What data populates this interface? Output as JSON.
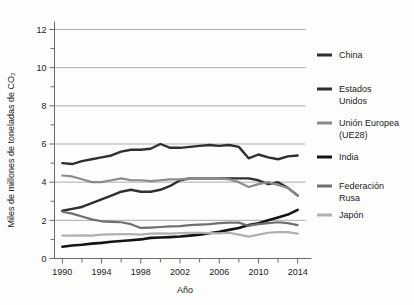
{
  "chart_data": {
    "type": "line",
    "title": "",
    "xlabel": "Año",
    "ylabel": "Miles de millones de toneladas de CO₂",
    "xlim": [
      1989.2,
      2014.8
    ],
    "ylim": [
      0,
      12
    ],
    "xticks": [
      1990,
      1994,
      1998,
      2002,
      2006,
      2010,
      2014
    ],
    "xticklabels": [
      "1990",
      "1994",
      "1998",
      "2002",
      "2006",
      "2010",
      "2014"
    ],
    "yticks": [
      0,
      2,
      4,
      6,
      8,
      10,
      12
    ],
    "yticklabels": [
      "0",
      "2",
      "4",
      "6",
      "8",
      "10",
      "12"
    ],
    "y_minor_ticks": [
      1,
      3,
      5,
      7,
      9,
      11
    ],
    "grid": "horizontal",
    "legend_position": "right",
    "x": [
      1990,
      1991,
      1992,
      1993,
      1994,
      1995,
      1996,
      1997,
      1998,
      1999,
      2000,
      2001,
      2002,
      2003,
      2004,
      2005,
      2006,
      2007,
      2008,
      2009,
      2010,
      2011,
      2012,
      2013,
      2014
    ],
    "series": [
      {
        "name": "China",
        "color": "#2f2f2f",
        "width": 2.4,
        "values": [
          2.5,
          2.6,
          2.7,
          2.9,
          3.1,
          3.3,
          3.5,
          3.6,
          3.5,
          3.5,
          3.6,
          3.8,
          4.1,
          4.2,
          4.2,
          4.2,
          4.2,
          4.2,
          4.2,
          4.2,
          4.1,
          3.9,
          4.0,
          3.7,
          3.3
        ]
      },
      {
        "name": "Estados Unidos",
        "color": "#2f2f2f",
        "width": 2.4,
        "values": [
          5.0,
          4.95,
          5.1,
          5.2,
          5.3,
          5.4,
          5.6,
          5.7,
          5.7,
          5.75,
          6.0,
          5.8,
          5.8,
          5.85,
          5.9,
          5.95,
          5.9,
          5.95,
          5.85,
          5.25,
          5.45,
          5.3,
          5.2,
          5.35,
          5.4
        ]
      },
      {
        "name": "Unión Europea (UE28)",
        "color": "#8c8c8c",
        "width": 2.2,
        "values": [
          4.35,
          4.3,
          4.15,
          4.0,
          4.0,
          4.1,
          4.2,
          4.1,
          4.1,
          4.05,
          4.1,
          4.15,
          4.15,
          4.2,
          4.2,
          4.2,
          4.2,
          4.15,
          4.0,
          3.75,
          3.9,
          4.0,
          3.85,
          3.7,
          3.3
        ]
      },
      {
        "name": "India",
        "color": "#141414",
        "width": 2.6,
        "values": [
          0.62,
          0.68,
          0.72,
          0.78,
          0.82,
          0.88,
          0.92,
          0.96,
          1.0,
          1.08,
          1.1,
          1.12,
          1.15,
          1.2,
          1.25,
          1.32,
          1.4,
          1.5,
          1.6,
          1.75,
          1.85,
          2.0,
          2.15,
          2.3,
          2.55
        ]
      },
      {
        "name": "Federación Rusa",
        "color": "#6f6f6f",
        "width": 2.2,
        "values": [
          2.45,
          2.35,
          2.2,
          2.05,
          1.95,
          1.92,
          1.9,
          1.8,
          1.6,
          1.62,
          1.65,
          1.68,
          1.7,
          1.75,
          1.78,
          1.8,
          1.85,
          1.88,
          1.88,
          1.72,
          1.8,
          1.85,
          1.9,
          1.85,
          1.75
        ]
      },
      {
        "name": "Japón",
        "color": "#b0b0b0",
        "width": 2.2,
        "values": [
          1.2,
          1.2,
          1.21,
          1.2,
          1.25,
          1.26,
          1.28,
          1.28,
          1.25,
          1.3,
          1.32,
          1.3,
          1.33,
          1.35,
          1.35,
          1.33,
          1.32,
          1.35,
          1.25,
          1.15,
          1.25,
          1.35,
          1.38,
          1.38,
          1.3
        ]
      }
    ],
    "legend": [
      {
        "label": "China",
        "color": "#2f2f2f",
        "lines": [
          "China"
        ]
      },
      {
        "label": "Estados Unidos",
        "color": "#2f2f2f",
        "lines": [
          "Estados",
          "Unidos"
        ]
      },
      {
        "label": "Unión Europea (UE28)",
        "color": "#8c8c8c",
        "lines": [
          "Unión Europea",
          "(UE28)"
        ]
      },
      {
        "label": "India",
        "color": "#141414",
        "lines": [
          "India"
        ]
      },
      {
        "label": "Federación Rusa",
        "color": "#6f6f6f",
        "lines": [
          "Federación",
          "Rusa"
        ]
      },
      {
        "label": "Japón",
        "color": "#b0b0b0",
        "lines": [
          "Japón"
        ]
      }
    ]
  }
}
